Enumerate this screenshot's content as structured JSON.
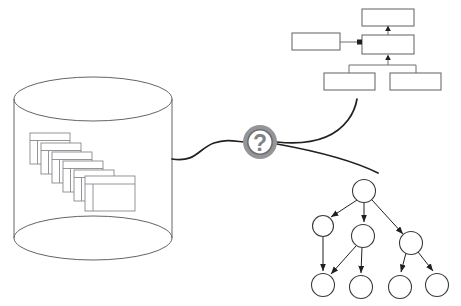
{
  "diagram": {
    "background_color": "#ffffff",
    "width": 461,
    "height": 306,
    "line_color": "#231f20",
    "box_stroke_color": "#6d6e71",
    "cylinder_stroke_color": "#636466",
    "window_stroke_color": "#808285",
    "accent_gray": "#939598"
  },
  "database": {
    "name": "document-database-cylinder",
    "label": "",
    "cylinder": {
      "cx": 93,
      "top_cy": 99,
      "bottom_cy": 238,
      "rx": 79,
      "ry": 22
    },
    "documents": {
      "count": 6,
      "label": "",
      "items": [
        {
          "x": 30,
          "y": 133,
          "w": 40,
          "h": 31
        },
        {
          "x": 41,
          "y": 143,
          "w": 40,
          "h": 31
        },
        {
          "x": 52,
          "y": 153,
          "w": 40,
          "h": 31
        },
        {
          "x": 63,
          "y": 163,
          "w": 40,
          "h": 31
        },
        {
          "x": 74,
          "y": 172,
          "w": 40,
          "h": 31
        },
        {
          "x": 85,
          "y": 176,
          "w": 50,
          "h": 35
        }
      ]
    }
  },
  "query_node": {
    "name": "question-mark-node",
    "glyph": "?",
    "label": "",
    "cx": 260,
    "cy": 142,
    "outer_r": 17,
    "inner_r": 12.5
  },
  "connectors": {
    "database_to_query": {
      "name": "connector-database-to-query",
      "path": "M 172 159 C 196 162 200 148 214 143 C 226 139 234 141 243 142"
    },
    "query_to_flowchart": {
      "name": "connector-query-to-flowchart",
      "path": "M 277 143 C 310 147 340 135 357 100"
    },
    "query_to_tree": {
      "name": "connector-query-to-tree",
      "path": "M 277 144 C 312 150 355 160 378 172"
    }
  },
  "flowchart": {
    "name": "uml-flowchart",
    "title": "",
    "boxes": [
      {
        "id": "top",
        "label": "",
        "x": 362,
        "y": 9,
        "w": 52,
        "h": 17
      },
      {
        "id": "left",
        "label": "",
        "x": 292,
        "y": 33,
        "w": 48,
        "h": 17
      },
      {
        "id": "center",
        "label": "",
        "x": 362,
        "y": 35,
        "w": 52,
        "h": 19
      },
      {
        "id": "bottom-left",
        "label": "",
        "x": 324,
        "y": 73,
        "w": 51,
        "h": 17
      },
      {
        "id": "bottom-right",
        "label": "",
        "x": 390,
        "y": 73,
        "w": 51,
        "h": 17
      }
    ],
    "edges": [
      {
        "from": "center",
        "to": "top",
        "arrow": "up"
      },
      {
        "from": "left",
        "to": "center",
        "arrow": "square"
      },
      {
        "from": "bottom-group",
        "to": "center",
        "arrow": "up"
      },
      {
        "from": "center",
        "to": "bottom-left",
        "arrow": "none"
      },
      {
        "from": "center",
        "to": "bottom-right",
        "arrow": "none"
      }
    ]
  },
  "tree": {
    "name": "tree-graph",
    "title": "",
    "node_radius": 11,
    "nodes": [
      {
        "id": "root",
        "label": "",
        "cx": 364,
        "cy": 191
      },
      {
        "id": "n1",
        "label": "",
        "cx": 323,
        "cy": 226
      },
      {
        "id": "n2",
        "label": "",
        "cx": 363,
        "cy": 236
      },
      {
        "id": "n3",
        "label": "",
        "cx": 411,
        "cy": 243
      },
      {
        "id": "l1",
        "label": "",
        "cx": 323,
        "cy": 285
      },
      {
        "id": "l2",
        "label": "",
        "cx": 361,
        "cy": 287
      },
      {
        "id": "l3",
        "label": "",
        "cx": 400,
        "cy": 287
      },
      {
        "id": "l4",
        "label": "",
        "cx": 437,
        "cy": 285
      }
    ],
    "edges": [
      {
        "from": "root",
        "to": "n1"
      },
      {
        "from": "root",
        "to": "n2"
      },
      {
        "from": "root",
        "to": "n3"
      },
      {
        "from": "n1",
        "to": "l1"
      },
      {
        "from": "n2",
        "to": "l1"
      },
      {
        "from": "n2",
        "to": "l2"
      },
      {
        "from": "n3",
        "to": "l3"
      },
      {
        "from": "n3",
        "to": "l4"
      }
    ]
  }
}
